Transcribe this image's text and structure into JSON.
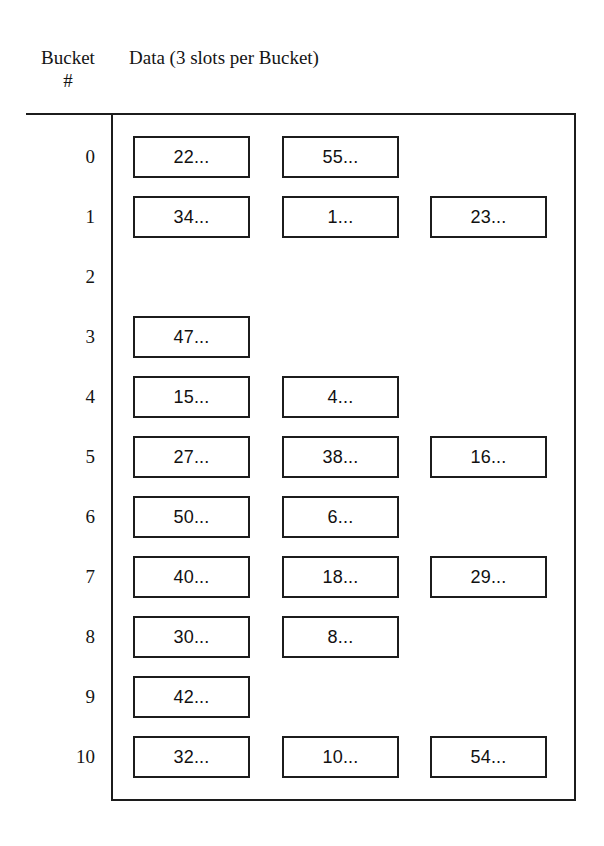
{
  "figure": {
    "title_columns": {
      "bucket_heading_line1": "Bucket",
      "bucket_heading_line2": "#",
      "data_heading": "Data (3 slots per Bucket)"
    },
    "slots_per_bucket": 3,
    "ellipsis": "...",
    "colors": {
      "ink": "#1c1c1c",
      "text": "#141414",
      "background": "#ffffff"
    },
    "buckets": [
      {
        "index": "0",
        "slots": [
          "22...",
          "55..."
        ]
      },
      {
        "index": "1",
        "slots": [
          "34...",
          "1...",
          "23..."
        ]
      },
      {
        "index": "2",
        "slots": []
      },
      {
        "index": "3",
        "slots": [
          "47..."
        ]
      },
      {
        "index": "4",
        "slots": [
          "15...",
          "4..."
        ]
      },
      {
        "index": "5",
        "slots": [
          "27...",
          "38...",
          "16..."
        ]
      },
      {
        "index": "6",
        "slots": [
          "50...",
          "6..."
        ]
      },
      {
        "index": "7",
        "slots": [
          "40...",
          "18...",
          "29..."
        ]
      },
      {
        "index": "8",
        "slots": [
          "30...",
          "8..."
        ]
      },
      {
        "index": "9",
        "slots": [
          "42..."
        ]
      },
      {
        "index": "10",
        "slots": [
          "32...",
          "10...",
          "54..."
        ]
      }
    ]
  }
}
